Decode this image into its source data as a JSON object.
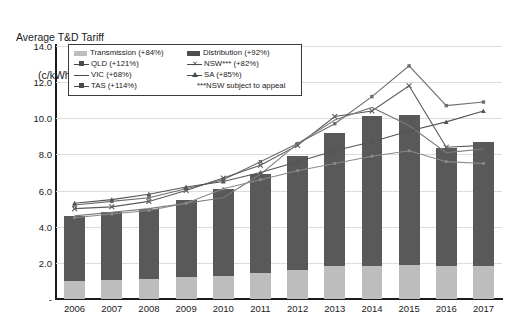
{
  "title": {
    "line1": "Average T&D Tariff",
    "line2": "(c/kWh)"
  },
  "legend": {
    "transmission": "Transmission (+84%)",
    "distribution": "Distribution (+92%)",
    "qld": "QLD (+121%)",
    "nsw": "NSW*** (+82%)",
    "vic": "VIC (+68%)",
    "sa": "SA (+85%)",
    "tas": "TAS (+114%)",
    "note": "***NSW subject to appeal"
  },
  "chart_data": {
    "type": "bar",
    "title": "Average T&D Tariff (c/kWh)",
    "xlabel": "",
    "ylabel": "c/kWh",
    "ylim": [
      0,
      14
    ],
    "yticks": [
      "-",
      "2.0",
      "4.0",
      "6.0",
      "8.0",
      "10.0",
      "12.0",
      "14.0"
    ],
    "ytick_values": [
      0,
      2,
      4,
      6,
      8,
      10,
      12,
      14
    ],
    "grid": true,
    "legend_position": "top-left-inset",
    "categories": [
      "2006",
      "2007",
      "2008",
      "2009",
      "2010",
      "2011",
      "2012",
      "2013",
      "2014",
      "2015",
      "2016",
      "2017"
    ],
    "stacked_series": [
      {
        "name": "Transmission (+84%)",
        "color": "#bdbdbd",
        "values": [
          1.0,
          1.05,
          1.1,
          1.2,
          1.3,
          1.45,
          1.6,
          1.8,
          1.85,
          1.9,
          1.85,
          1.85
        ]
      },
      {
        "name": "Distribution (+92%)",
        "color": "#595959",
        "values": [
          3.6,
          3.75,
          3.9,
          4.3,
          4.8,
          5.45,
          6.3,
          7.4,
          8.25,
          8.3,
          6.5,
          6.85
        ]
      }
    ],
    "bar_totals": [
      4.6,
      4.8,
      5.0,
      5.5,
      6.1,
      6.9,
      7.9,
      9.2,
      10.1,
      10.2,
      8.35,
      8.7
    ],
    "series": [
      {
        "name": "QLD (+121%)",
        "marker": "square",
        "color": "#6e6e6e",
        "values": [
          5.2,
          5.4,
          5.6,
          6.1,
          6.6,
          7.6,
          8.6,
          9.7,
          11.2,
          12.9,
          10.7,
          10.9
        ]
      },
      {
        "name": "NSW*** (+82%)",
        "marker": "x",
        "color": "#5a5a5a",
        "values": [
          5.0,
          5.1,
          5.4,
          6.0,
          6.7,
          7.4,
          8.5,
          10.1,
          10.4,
          11.8,
          8.4,
          8.5
        ]
      },
      {
        "name": "VIC (+68%)",
        "marker": "none",
        "color": "#7a7a7a",
        "values": [
          4.6,
          4.8,
          5.0,
          5.3,
          5.6,
          6.9,
          8.6,
          9.9,
          10.6,
          9.6,
          8.1,
          8.3
        ]
      },
      {
        "name": "SA (+85%)",
        "marker": "triangle",
        "color": "#555555",
        "values": [
          5.3,
          5.5,
          5.8,
          6.2,
          6.5,
          7.0,
          7.6,
          8.2,
          8.7,
          9.3,
          9.8,
          10.4
        ]
      },
      {
        "name": "TAS (+114%)",
        "marker": "square-small",
        "color": "#8a8a8a",
        "values": [
          4.5,
          4.7,
          4.9,
          5.3,
          6.1,
          6.6,
          7.1,
          7.5,
          7.9,
          8.2,
          7.6,
          7.5
        ]
      }
    ]
  }
}
